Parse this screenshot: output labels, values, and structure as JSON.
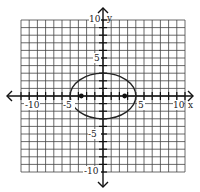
{
  "diagram": {
    "type": "coordinate-plane",
    "x_axis": {
      "label": "x",
      "min": -10,
      "max": 10,
      "ticks_labeled": [
        "-10",
        "-5",
        "5",
        "10"
      ]
    },
    "y_axis": {
      "label": "y",
      "min": -10,
      "max": 10,
      "ticks_labeled": [
        "10",
        "5",
        "-5",
        "-10"
      ]
    },
    "curve": {
      "kind": "ellipse",
      "equation": "x^2/16 + y^2/9 = 1",
      "center": [
        0,
        0
      ],
      "semi_major": 4,
      "semi_minor": 3
    },
    "points": [
      {
        "name": "focus-left",
        "x": -2.65,
        "y": 0
      },
      {
        "name": "focus-right",
        "x": 2.65,
        "y": 0
      }
    ],
    "colors": {
      "grid": "#333333",
      "axis": "#111111",
      "curve": "#222222"
    }
  }
}
